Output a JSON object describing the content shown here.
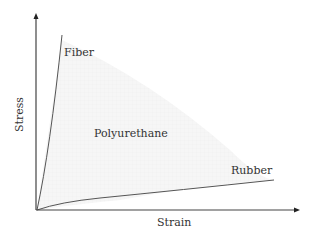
{
  "diagram": {
    "type": "stress-strain",
    "axes": {
      "x_label": "Strain",
      "y_label": "Stress"
    },
    "curves": [
      {
        "name": "Fiber",
        "label": "Fiber"
      },
      {
        "name": "Rubber",
        "label": "Rubber"
      }
    ],
    "region": {
      "name": "Polyurethane",
      "label": "Polyurethane"
    },
    "colors": {
      "axis": "#444444",
      "curve": "#555555",
      "region_fill": "#f3f3f3",
      "text": "#333333"
    }
  }
}
